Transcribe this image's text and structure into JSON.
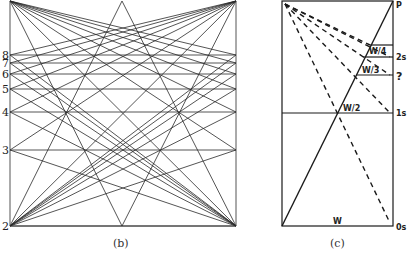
{
  "figure_b": {
    "caption": "(b)",
    "level_labels": [
      "8",
      "7",
      "6",
      "5",
      "4",
      "3",
      "2"
    ],
    "level_y": [
      55,
      63,
      74,
      89,
      112,
      150,
      226
    ],
    "frame": {
      "left": 10,
      "right": 236,
      "top": 1,
      "bottom": 226,
      "apex_x": 122
    }
  },
  "figure_c": {
    "caption": "(c)",
    "top_label": "P",
    "right_labels": {
      "two_s": "2s",
      "unknown": "?",
      "one_s": "1s",
      "zero_s": "0s"
    },
    "segment_labels": {
      "w4": "W/4",
      "w3": "W/3",
      "w2": "W/2",
      "w": "W"
    },
    "frame": {
      "left": 282,
      "right": 393,
      "top": 1,
      "bottom": 226
    }
  },
  "colors": {
    "line": "#2a2a2a",
    "background": "#ffffff"
  }
}
